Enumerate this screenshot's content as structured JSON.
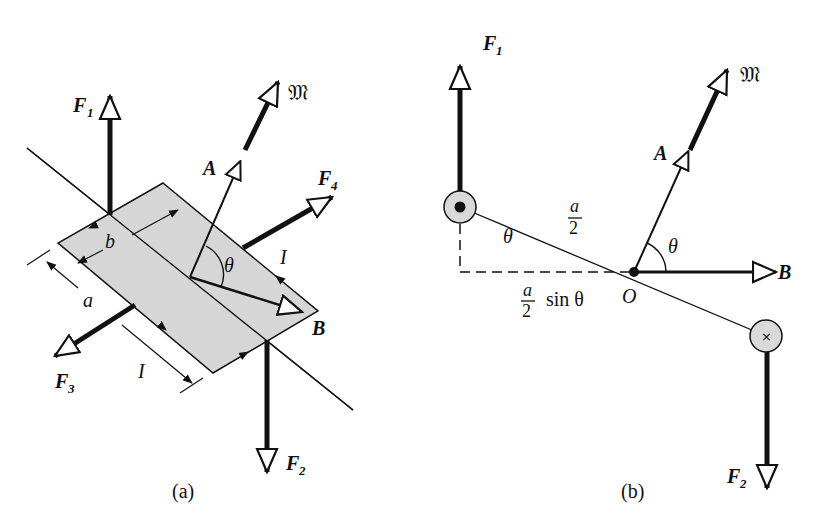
{
  "figure": {
    "panels": [
      {
        "id": "a",
        "caption": "(a)",
        "labels": {
          "F1": "F",
          "F1_sub": "1",
          "F2": "F",
          "F2_sub": "2",
          "F3": "F",
          "F3_sub": "3",
          "F4": "F",
          "F4_sub": "4",
          "A": "A",
          "M": "𝔐",
          "B": "B",
          "theta": "θ",
          "I_top": "I",
          "I_bottom": "I",
          "a": "a",
          "b": "b"
        }
      },
      {
        "id": "b",
        "caption": "(b)",
        "labels": {
          "F1": "F",
          "F1_sub": "1",
          "F2": "F",
          "F2_sub": "2",
          "A": "A",
          "M": "𝔐",
          "B": "B",
          "O": "O",
          "theta_left": "θ",
          "theta_right": "θ",
          "half_a_num": "a",
          "half_a_den": "2",
          "proj_num": "a",
          "proj_den": "2",
          "proj_text": "sin θ",
          "current_out": "•",
          "current_in": "×"
        }
      }
    ],
    "colors": {
      "ink": "#111111",
      "loop_fill": "#d6d6d6",
      "conductor_fill": "#d9d9d9",
      "background": "#ffffff"
    }
  }
}
